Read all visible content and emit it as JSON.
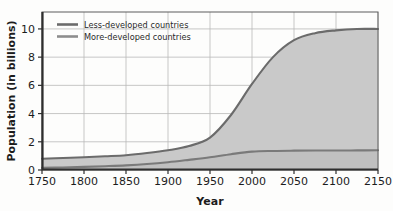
{
  "chart_data": {
    "type": "area",
    "title": "",
    "xlabel": "Year",
    "ylabel": "Population (in billions)",
    "xlim": [
      1750,
      2150
    ],
    "ylim": [
      0,
      11.2
    ],
    "xticks": [
      "1750",
      "1800",
      "1850",
      "1900",
      "1950",
      "2000",
      "2050",
      "2100",
      "2150"
    ],
    "xtick_values": [
      1750,
      1800,
      1850,
      1900,
      1950,
      2000,
      2050,
      2100,
      2150
    ],
    "yticks": [
      "0",
      "2",
      "4",
      "6",
      "8",
      "10"
    ],
    "ytick_values": [
      0,
      2,
      4,
      6,
      8,
      10
    ],
    "grid": true,
    "legend_position": "top-left",
    "x": [
      1750,
      1775,
      1800,
      1825,
      1850,
      1875,
      1900,
      1925,
      1950,
      1975,
      2000,
      2025,
      2050,
      2075,
      2100,
      2125,
      2150
    ],
    "series": [
      {
        "name": "Less-developed countries",
        "color": "#6b6b6b",
        "values": [
          0.8,
          0.85,
          0.9,
          0.97,
          1.05,
          1.2,
          1.4,
          1.7,
          2.3,
          3.9,
          6.1,
          8.0,
          9.2,
          9.7,
          9.9,
          10.0,
          10.0
        ]
      },
      {
        "name": "More-developed countries",
        "color": "#7a7a7a",
        "values": [
          0.15,
          0.18,
          0.22,
          0.27,
          0.33,
          0.42,
          0.55,
          0.72,
          0.9,
          1.12,
          1.3,
          1.35,
          1.37,
          1.38,
          1.38,
          1.39,
          1.4
        ]
      }
    ],
    "fill_color": "#c9c9c9",
    "grid_color": "#b9b9b9",
    "axis_color": "#3a3a3a"
  },
  "legend": {
    "items": [
      {
        "label": "Less-developed countries"
      },
      {
        "label": "More-developed countries"
      }
    ]
  }
}
